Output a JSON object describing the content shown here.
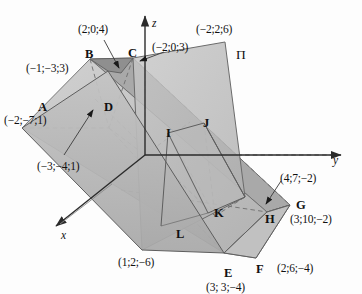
{
  "figure": {
    "background": "#fdfdfd",
    "width": 362,
    "height": 294
  },
  "axes": {
    "z": {
      "label": "z",
      "x": 152,
      "y": 18
    },
    "y": {
      "label": "y",
      "x": 333,
      "y": 155
    },
    "x": {
      "label": "x",
      "x": 61,
      "y": 230
    }
  },
  "plane": {
    "label": "П",
    "x": 236,
    "y": 48,
    "fill": "#b9b9b9",
    "stroke": "#6f6f6f"
  },
  "colors": {
    "solid_light": "#c9c9c9",
    "solid_mid": "#b5b5b5",
    "solid_dark": "#9a9a9a",
    "plane_fill": "#bdbdbd",
    "edge": "#5a5a5a",
    "dashed": "#7d7d7d",
    "axis": "#2b2b2b",
    "text": "#111111"
  },
  "vertices": [
    {
      "name": "A",
      "label": "A",
      "lx": 38,
      "ly": 101,
      "coord": "(−2;−7;1)",
      "cx": 4,
      "cy": 115,
      "has_leader": false
    },
    {
      "name": "B",
      "label": "B",
      "lx": 85,
      "ly": 48,
      "coord": "(−1;−3;3)",
      "cx": 26,
      "cy": 63,
      "has_leader": false
    },
    {
      "name": "C",
      "label": "C",
      "lx": 128,
      "ly": 47,
      "coord": "(−2;0;3)",
      "cx": 152,
      "cy": 42,
      "has_leader": false
    },
    {
      "name": "D",
      "label": "D",
      "lx": 104,
      "ly": 101,
      "coord": "(−3;−4;1)",
      "cx": 37,
      "cy": 161,
      "has_leader": true
    },
    {
      "name": "E",
      "label": "E",
      "lx": 224,
      "ly": 267,
      "coord": "(3; 3;−4)",
      "cx": 206,
      "cy": 282,
      "has_leader": false
    },
    {
      "name": "F",
      "label": "F",
      "lx": 256,
      "ly": 263,
      "coord": "(2;6;−4)",
      "cx": 277,
      "cy": 263,
      "has_leader": false
    },
    {
      "name": "G",
      "label": "G",
      "lx": 296,
      "ly": 199,
      "coord": "(3;10;−2)",
      "cx": 290,
      "cy": 214,
      "has_leader": false
    },
    {
      "name": "H",
      "label": "H",
      "lx": 265,
      "ly": 213,
      "coord": "(4;7;−2)",
      "cx": 280,
      "cy": 173,
      "has_leader": true
    },
    {
      "name": "I",
      "label": "I",
      "lx": 166,
      "ly": 127,
      "coord": "",
      "cx": 0,
      "cy": 0,
      "has_leader": false
    },
    {
      "name": "J",
      "label": "J",
      "lx": 203,
      "ly": 117,
      "coord": "",
      "cx": 0,
      "cy": 0,
      "has_leader": false
    },
    {
      "name": "K",
      "label": "K",
      "lx": 214,
      "ly": 207,
      "coord": "",
      "cx": 0,
      "cy": 0,
      "has_leader": false
    },
    {
      "name": "L",
      "label": "L",
      "lx": 176,
      "ly": 228,
      "coord": "",
      "cx": 0,
      "cy": 0,
      "has_leader": false
    }
  ],
  "extra_coords": [
    {
      "id": "top-arrow-coord",
      "text": "(2;0;4)",
      "x": 78,
      "y": 24,
      "has_leader": true
    },
    {
      "id": "plane-top-coord",
      "text": "(−2;2;6)",
      "x": 196,
      "y": 24,
      "has_leader": false
    },
    {
      "id": "bottom-left-coord",
      "text": "(1;2;−6)",
      "x": 118,
      "y": 257,
      "has_leader": false
    }
  ],
  "leaders": [
    {
      "id": "leader-2-0-4",
      "from": [
        104,
        40
      ],
      "to": [
        119,
        68
      ]
    },
    {
      "id": "leader-minus3-minus4-1",
      "from": [
        64,
        155
      ],
      "to": [
        93,
        110
      ]
    },
    {
      "id": "leader-4-7-minus2",
      "from": [
        281,
        181
      ],
      "to": [
        265,
        205
      ]
    },
    {
      "id": "leader-x-axis-callout",
      "from": [
        112,
        184
      ],
      "to": [
        57,
        226
      ]
    }
  ]
}
